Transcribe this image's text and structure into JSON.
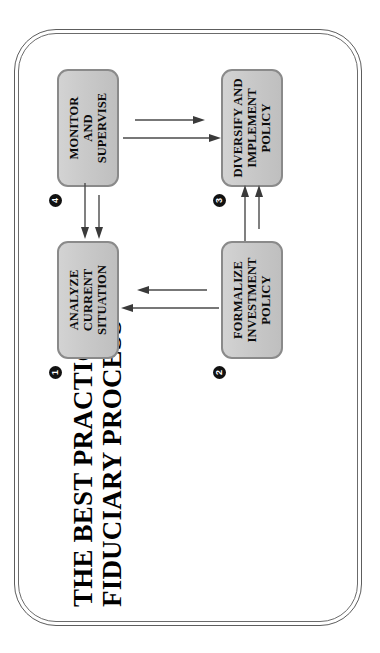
{
  "document": {
    "title_lines": [
      "THE BEST PRACTICES",
      "FIDUCIARY PROCESS"
    ],
    "title_full": "THE BEST PRACTICES FIDUCIARY PROCESS",
    "orientation": "rotated-90-counterclockwise",
    "frame": {
      "style": "double-line rounded rectangle",
      "stroke_color": "#5d5d5d"
    }
  },
  "diagram": {
    "type": "cycle-flowchart",
    "node_fill": "#c9c9c9",
    "node_border": "#8a8a8a",
    "badge_color": "#111111",
    "arrow_color": "#4a4a4a",
    "nodes": [
      {
        "number": "1",
        "badge_glyph": "❶",
        "label": "ANALYZE\nCURRENT\nSITUATION",
        "label_flat": "ANALYZE CURRENT SITUATION"
      },
      {
        "number": "2",
        "badge_glyph": "❷",
        "label": "FORMALIZE\nINVESTMENT\nPOLICY",
        "label_flat": "FORMALIZE INVESTMENT POLICY"
      },
      {
        "number": "3",
        "badge_glyph": "❸",
        "label": "DIVERSIFY AND\nIMPLEMENT\nPOLICY",
        "label_flat": "DIVERSIFY AND IMPLEMENT POLICY"
      },
      {
        "number": "4",
        "badge_glyph": "❹",
        "label": "MONITOR\nAND\nSUPERVISE",
        "label_flat": "MONITOR AND SUPERVISE"
      }
    ],
    "connectors": [
      {
        "from": "1",
        "to": "2",
        "direction": "up",
        "style": "double-line-arrow"
      },
      {
        "from": "2",
        "to": "3",
        "direction": "right",
        "style": "double-line-arrow"
      },
      {
        "from": "3",
        "to": "4",
        "direction": "down",
        "style": "double-line-arrow"
      },
      {
        "from": "4",
        "to": "1",
        "direction": "left",
        "style": "double-line-arrow"
      }
    ]
  }
}
